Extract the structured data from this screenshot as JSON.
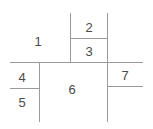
{
  "diagram": {
    "type": "line-partition-diagram",
    "width": 153,
    "height": 129,
    "background_color": "#ffffff",
    "line_color": "#9a9a9a",
    "line_width": 1,
    "label_color": "#4a4a4a",
    "label_font_size": 13,
    "regions": [
      {
        "id": "region-1",
        "label": "1",
        "x": 38,
        "y": 41
      },
      {
        "id": "region-2",
        "label": "2",
        "x": 89,
        "y": 27
      },
      {
        "id": "region-3",
        "label": "3",
        "x": 89,
        "y": 51
      },
      {
        "id": "region-4",
        "label": "4",
        "x": 22,
        "y": 77
      },
      {
        "id": "region-5",
        "label": "5",
        "x": 22,
        "y": 102
      },
      {
        "id": "region-6",
        "label": "6",
        "x": 72,
        "y": 89
      },
      {
        "id": "region-7",
        "label": "7",
        "x": 125,
        "y": 75
      }
    ],
    "segments": [
      {
        "id": "segment-main-horizontal",
        "orientation": "horizontal",
        "x1": 10,
        "y1": 62,
        "x2": 143,
        "y2": 62
      },
      {
        "id": "segment-left-vertical",
        "orientation": "vertical",
        "x1": 39,
        "y1": 62,
        "x2": 39,
        "y2": 122
      },
      {
        "id": "segment-four-five-divider",
        "orientation": "horizontal",
        "x1": 10,
        "y1": 88,
        "x2": 39,
        "y2": 88
      },
      {
        "id": "segment-top-left-vertical",
        "orientation": "vertical",
        "x1": 70,
        "y1": 13,
        "x2": 70,
        "y2": 62
      },
      {
        "id": "segment-top-right-vertical",
        "orientation": "vertical",
        "x1": 107,
        "y1": 13,
        "x2": 107,
        "y2": 62
      },
      {
        "id": "segment-two-three-divider",
        "orientation": "horizontal",
        "x1": 70,
        "y1": 38,
        "x2": 107,
        "y2": 38
      },
      {
        "id": "segment-right-vertical",
        "orientation": "vertical",
        "x1": 107,
        "y1": 62,
        "x2": 107,
        "y2": 122
      },
      {
        "id": "segment-seven-divider",
        "orientation": "horizontal",
        "x1": 107,
        "y1": 86,
        "x2": 143,
        "y2": 86
      }
    ]
  }
}
